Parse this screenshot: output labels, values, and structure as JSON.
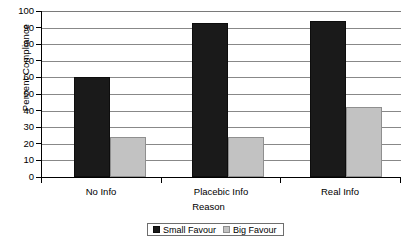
{
  "chart_data": {
    "type": "bar",
    "title": "",
    "xlabel": "Reason",
    "ylabel": "Percent Compliance",
    "categories": [
      "No Info",
      "Placebic Info",
      "Real Info"
    ],
    "series": [
      {
        "name": "Small Favour",
        "values": [
          60,
          93,
          94
        ],
        "color": "#1a1a1a"
      },
      {
        "name": "Big Favour",
        "values": [
          24,
          24,
          42
        ],
        "color": "#c2c2c2"
      }
    ],
    "ylim": [
      0,
      100
    ],
    "ytick_step": 10,
    "yticks": [
      "100",
      "90",
      "80",
      "70",
      "60",
      "50",
      "40",
      "30",
      "20",
      "10",
      "0"
    ],
    "grid": true,
    "legend_position": "bottom-center",
    "legend_entries": [
      "Small Favour",
      "Big Favour"
    ]
  }
}
